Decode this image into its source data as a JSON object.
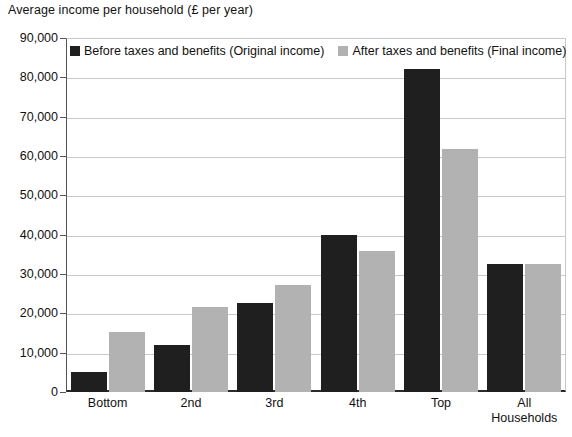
{
  "chart_data": {
    "type": "bar",
    "title": "Average income per household  (£ per year)",
    "xlabel": "",
    "ylabel": "",
    "ylim": [
      0,
      90000
    ],
    "ytick_step": 10000,
    "ytick_labels": [
      "0",
      "10,000",
      "20,000",
      "30,000",
      "40,000",
      "50,000",
      "60,000",
      "70,000",
      "80,000",
      "90,000"
    ],
    "ytick_values": [
      0,
      10000,
      20000,
      30000,
      40000,
      50000,
      60000,
      70000,
      80000,
      90000
    ],
    "grid": true,
    "legend_position": "top-left-inside",
    "categories": [
      "Bottom",
      "2nd",
      "3rd",
      "4th",
      "Top",
      "All Households"
    ],
    "series": [
      {
        "name": "Before taxes and benefits (Original income)",
        "color": "#1f1f1f",
        "values": [
          5000,
          12000,
          22700,
          39800,
          82000,
          32500
        ]
      },
      {
        "name": "After taxes and benefits (Final income)",
        "color": "#b2b2b2",
        "values": [
          15300,
          21500,
          27300,
          35900,
          61800,
          32500
        ]
      }
    ]
  },
  "legend": {
    "items": [
      {
        "label": "Before taxes and benefits (Original income)",
        "swatch": "before"
      },
      {
        "label": "After taxes and benefits (Final income)",
        "swatch": "after"
      }
    ]
  },
  "colors": {
    "before": "#1f1f1f",
    "after": "#b2b2b2",
    "grid": "#c9c9c9",
    "axis": "#2b2b2b",
    "background": "#ffffff"
  }
}
